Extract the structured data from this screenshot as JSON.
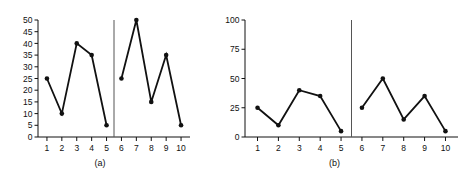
{
  "figure": {
    "panels": [
      {
        "id": "a",
        "caption": "(a)",
        "chart": {
          "type": "line",
          "title": "",
          "subtitle": "",
          "xlabel": "",
          "ylabel": "",
          "xlim": [
            0.4,
            10.6
          ],
          "ylim": [
            0,
            50
          ],
          "y_ticks": [
            0,
            5,
            10,
            15,
            20,
            25,
            30,
            35,
            40,
            45,
            50
          ],
          "y_tick_labels": [
            "0",
            "5",
            "10",
            "15",
            "20",
            "25",
            "30",
            "35",
            "40",
            "45",
            "50"
          ],
          "x_ticks": [
            1,
            2,
            3,
            4,
            5,
            6,
            7,
            8,
            9,
            10
          ],
          "x_tick_labels": [
            "1",
            "2",
            "3",
            "4",
            "5",
            "6",
            "7",
            "8",
            "9",
            "10"
          ],
          "grid": false,
          "legend": "none",
          "divider_x": 5.5,
          "markers": "filled-circle",
          "series": [
            {
              "name": "segment-1",
              "x": [
                1,
                2,
                3,
                4,
                5
              ],
              "values": [
                25,
                10,
                40,
                35,
                5
              ]
            },
            {
              "name": "segment-2",
              "x": [
                6,
                7,
                8,
                9,
                10
              ],
              "values": [
                25,
                50,
                15,
                35,
                5
              ]
            }
          ]
        }
      },
      {
        "id": "b",
        "caption": "(b)",
        "chart": {
          "type": "line",
          "title": "",
          "subtitle": "",
          "xlabel": "",
          "ylabel": "",
          "xlim": [
            0.4,
            10.6
          ],
          "ylim": [
            0,
            100
          ],
          "y_ticks": [
            0,
            25,
            50,
            75,
            100
          ],
          "y_tick_labels": [
            "0",
            "25",
            "50",
            "75",
            "100"
          ],
          "x_ticks": [
            1,
            2,
            3,
            4,
            5,
            6,
            7,
            8,
            9,
            10
          ],
          "x_tick_labels": [
            "1",
            "2",
            "3",
            "4",
            "5",
            "6",
            "7",
            "8",
            "9",
            "10"
          ],
          "grid": false,
          "legend": "none",
          "divider_x": 5.5,
          "markers": "filled-circle",
          "series": [
            {
              "name": "segment-1",
              "x": [
                1,
                2,
                3,
                4,
                5
              ],
              "values": [
                25,
                10,
                40,
                35,
                5
              ]
            },
            {
              "name": "segment-2",
              "x": [
                6,
                7,
                8,
                9,
                10
              ],
              "values": [
                25,
                50,
                15,
                35,
                5
              ]
            }
          ]
        }
      }
    ],
    "colors": {
      "line": "#111111",
      "marker": "#111111",
      "axis": "#111111",
      "divider": "#555555",
      "background": "#ffffff"
    }
  },
  "chart_data": [
    {
      "type": "line",
      "panel": "(a)",
      "title": "",
      "xlabel": "",
      "ylabel": "",
      "x": [
        1,
        2,
        3,
        4,
        5,
        6,
        7,
        8,
        9,
        10
      ],
      "categories": [
        "1",
        "2",
        "3",
        "4",
        "5",
        "6",
        "7",
        "8",
        "9",
        "10"
      ],
      "series": [
        {
          "name": "segment-1 (x 1-5)",
          "x": [
            1,
            2,
            3,
            4,
            5
          ],
          "values": [
            25,
            10,
            40,
            35,
            5
          ]
        },
        {
          "name": "segment-2 (x 6-10)",
          "x": [
            6,
            7,
            8,
            9,
            10
          ],
          "values": [
            25,
            50,
            15,
            35,
            5
          ]
        }
      ],
      "ylim": [
        0,
        50
      ],
      "xlim": [
        0.4,
        10.6
      ],
      "yticks": [
        0,
        5,
        10,
        15,
        20,
        25,
        30,
        35,
        40,
        45,
        50
      ],
      "xticks": [
        1,
        2,
        3,
        4,
        5,
        6,
        7,
        8,
        9,
        10
      ],
      "grid": false,
      "legend": "none",
      "annotations": [
        "vertical divider line between x=5 and x=6"
      ]
    },
    {
      "type": "line",
      "panel": "(b)",
      "title": "",
      "xlabel": "",
      "ylabel": "",
      "x": [
        1,
        2,
        3,
        4,
        5,
        6,
        7,
        8,
        9,
        10
      ],
      "categories": [
        "1",
        "2",
        "3",
        "4",
        "5",
        "6",
        "7",
        "8",
        "9",
        "10"
      ],
      "series": [
        {
          "name": "segment-1 (x 1-5)",
          "x": [
            1,
            2,
            3,
            4,
            5
          ],
          "values": [
            25,
            10,
            40,
            35,
            5
          ]
        },
        {
          "name": "segment-2 (x 6-10)",
          "x": [
            6,
            7,
            8,
            9,
            10
          ],
          "values": [
            25,
            50,
            15,
            35,
            5
          ]
        }
      ],
      "ylim": [
        0,
        100
      ],
      "xlim": [
        0.4,
        10.6
      ],
      "yticks": [
        0,
        25,
        50,
        75,
        100
      ],
      "xticks": [
        1,
        2,
        3,
        4,
        5,
        6,
        7,
        8,
        9,
        10
      ],
      "grid": false,
      "legend": "none",
      "annotations": [
        "vertical divider line between x=5 and x=6"
      ]
    }
  ]
}
